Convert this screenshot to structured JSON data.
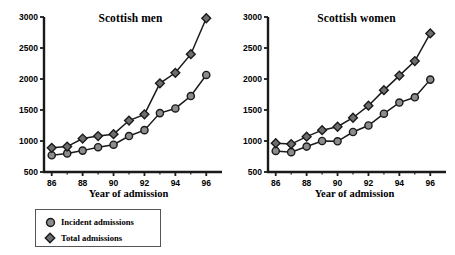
{
  "figure": {
    "background": "#ffffff",
    "marker_fill": "#8c8c8c",
    "marker_stroke": "#1a1a1a",
    "line_color": "#1a1a1a",
    "axis_color": "#1a1a1a"
  },
  "legend": {
    "position": "bottom-left",
    "entries": [
      {
        "label": "Incident admissions",
        "marker": "circle-marker-icon"
      },
      {
        "label": "Total admissions",
        "marker": "diamond-marker-icon"
      }
    ]
  },
  "chart_data": [
    {
      "type": "line",
      "title": "Scottish men",
      "xlabel": "Year of admission",
      "ylabel": "",
      "x": [
        86,
        87,
        88,
        89,
        90,
        91,
        92,
        93,
        94,
        95,
        96
      ],
      "xtick_labels": [
        "86",
        "",
        "88",
        "",
        "90",
        "",
        "92",
        "",
        "94",
        "",
        "96"
      ],
      "ytick_labels": [
        "500",
        "1000",
        "1500",
        "2000",
        "2500",
        "3000"
      ],
      "yticks": [
        500,
        1000,
        1500,
        2000,
        2500,
        3000
      ],
      "xlim": [
        85.5,
        96.5
      ],
      "ylim": [
        500,
        3000
      ],
      "grid": false,
      "legend_position": "below-figure-left",
      "series": [
        {
          "name": "Incident admissions",
          "marker": "circle",
          "values": [
            770,
            800,
            845,
            900,
            940,
            1080,
            1175,
            1450,
            1525,
            1725,
            2065
          ]
        },
        {
          "name": "Total admissions",
          "marker": "diamond",
          "values": [
            890,
            910,
            1040,
            1080,
            1110,
            1330,
            1430,
            1930,
            2100,
            2400,
            2980
          ]
        }
      ]
    },
    {
      "type": "line",
      "title": "Scottish women",
      "xlabel": "Year of admission",
      "ylabel": "",
      "x": [
        86,
        87,
        88,
        89,
        90,
        91,
        92,
        93,
        94,
        95,
        96
      ],
      "xtick_labels": [
        "86",
        "",
        "88",
        "",
        "90",
        "",
        "92",
        "",
        "94",
        "",
        "96"
      ],
      "ytick_labels": [
        "500",
        "1000",
        "1500",
        "2000",
        "2500",
        "3000"
      ],
      "yticks": [
        500,
        1000,
        1500,
        2000,
        2500,
        3000
      ],
      "xlim": [
        85.5,
        96.5
      ],
      "ylim": [
        500,
        3000
      ],
      "grid": false,
      "legend_position": "below-figure-left",
      "series": [
        {
          "name": "Incident admissions",
          "marker": "circle",
          "values": [
            840,
            820,
            910,
            1000,
            995,
            1145,
            1250,
            1440,
            1620,
            1705,
            1990
          ]
        },
        {
          "name": "Total admissions",
          "marker": "diamond",
          "values": [
            965,
            950,
            1070,
            1175,
            1230,
            1375,
            1570,
            1820,
            2055,
            2290,
            2735
          ]
        }
      ]
    }
  ]
}
